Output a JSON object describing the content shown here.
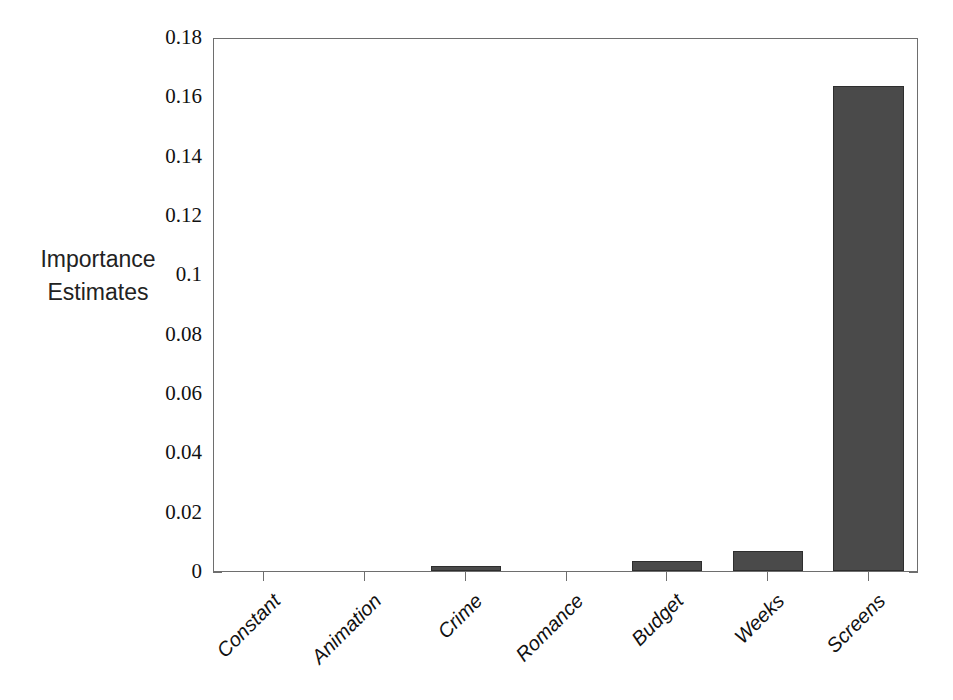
{
  "chart_data": {
    "type": "bar",
    "title": "",
    "subtitle": "",
    "xlabel": "",
    "ylabel": "Importance Estimates",
    "ylabel_lines": [
      "Importance",
      "Estimates"
    ],
    "categories": [
      "Constant",
      "Animation",
      "Crime",
      "Romance",
      "Budget",
      "Weeks",
      "Screens"
    ],
    "values": [
      0,
      0,
      0.0017,
      0,
      0.0034,
      0.0068,
      0.1635
    ],
    "ylim": [
      0,
      0.18
    ],
    "ytick_labels": [
      "0",
      "0.02",
      "0.04",
      "0.06",
      "0.08",
      "0.1",
      "0.12",
      "0.14",
      "0.16",
      "0.18"
    ],
    "ytick_values": [
      0,
      0.02,
      0.04,
      0.06,
      0.08,
      0.1,
      0.12,
      0.14,
      0.16,
      0.18
    ],
    "grid": false,
    "legend": false,
    "legend_position": "none",
    "bar_color": "#4a4a4a",
    "bar_edge_color": "#2e2e2e",
    "axis_color": "#6e6e6e",
    "background_color": "#ffffff",
    "xtick_rotation_degrees": -45
  }
}
